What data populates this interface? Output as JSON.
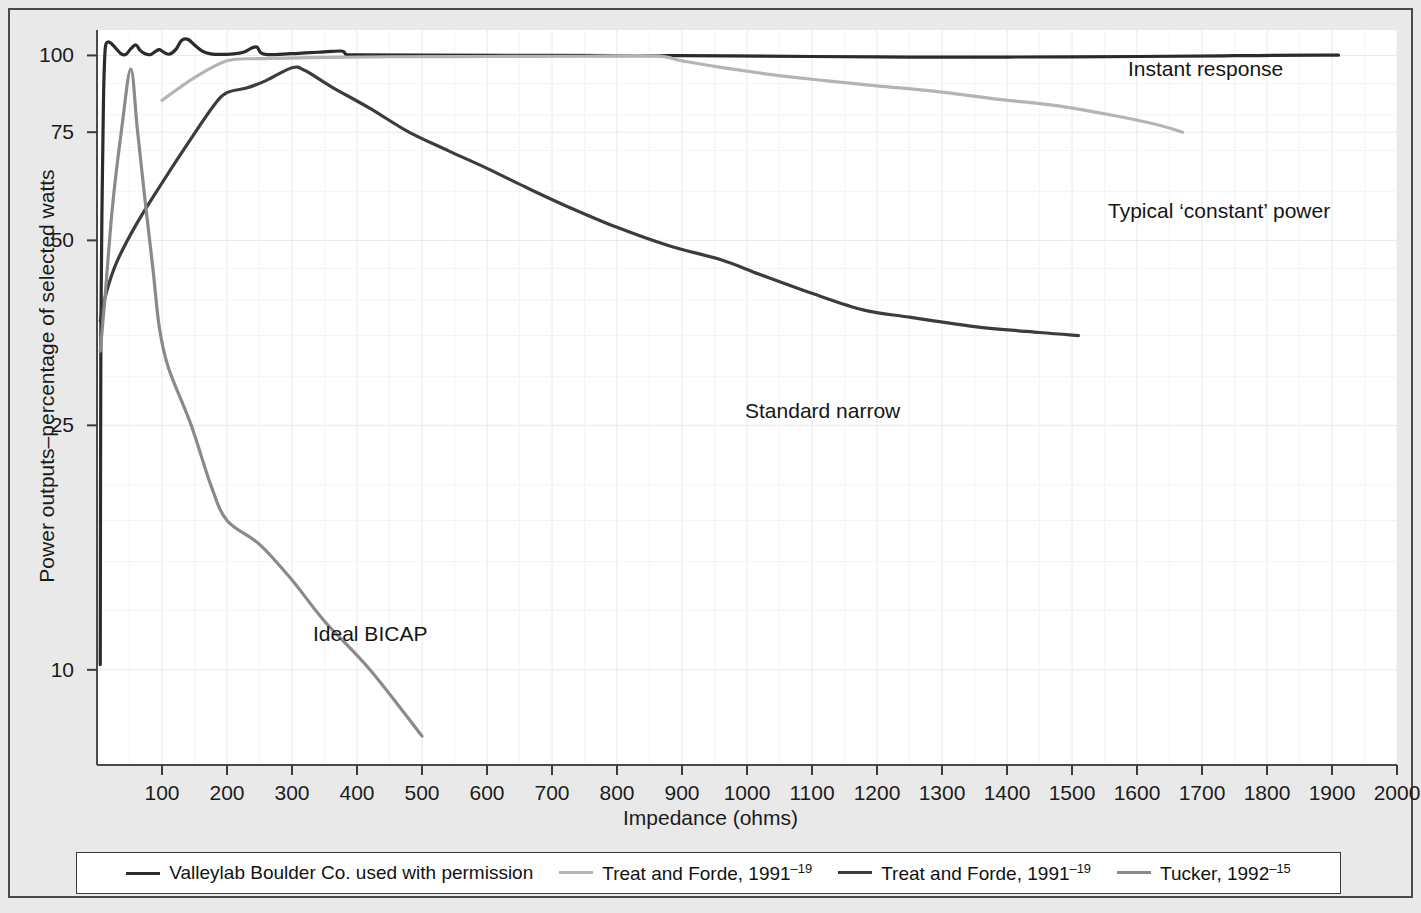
{
  "axes": {
    "y_title": "Power outputs–percentage of selected watts",
    "x_title": "Impedance (ohms)",
    "y_ticks": [
      "10",
      "25",
      "50",
      "75",
      "100"
    ],
    "x_ticks": [
      "100",
      "200",
      "300",
      "400",
      "500",
      "600",
      "700",
      "800",
      "900",
      "1000",
      "1100",
      "1200",
      "1300",
      "1400",
      "1500",
      "1600",
      "1700",
      "1800",
      "1900",
      "2000"
    ]
  },
  "annotations": {
    "instant_response": "Instant response",
    "typical_constant_power": "Typical ‘constant’ power",
    "standard_narrow": "Standard narrow",
    "ideal_bicap": "Ideal BICAP"
  },
  "legend": {
    "items": [
      {
        "label": "Valleylab Boulder Co. used with permission",
        "sup": "",
        "color": "#2b2b2b"
      },
      {
        "label": "Treat and Forde, 1991",
        "sup": "–19",
        "color": "#b4b4b4"
      },
      {
        "label": "Treat and Forde, 1991",
        "sup": "–19",
        "color": "#3c3c3c"
      },
      {
        "label": "Tucker, 1992",
        "sup": "–15",
        "color": "#8a8a8a"
      }
    ]
  },
  "chart_data": {
    "type": "line",
    "title": "",
    "xlabel": "Impedance (ohms)",
    "ylabel": "Power outputs–percentage of selected watts",
    "xlim": [
      0,
      2000
    ],
    "ylim": [
      7,
      110
    ],
    "y_scale": "log",
    "x_scale": "linear",
    "grid": true,
    "legend_position": "bottom",
    "y_ticks": [
      10,
      25,
      50,
      75,
      100
    ],
    "x_ticks": [
      100,
      200,
      300,
      400,
      500,
      600,
      700,
      800,
      900,
      1000,
      1100,
      1200,
      1300,
      1400,
      1500,
      1600,
      1700,
      1800,
      1900,
      2000
    ],
    "series": [
      {
        "name": "Valleylab Boulder Co. used with permission",
        "annotation": "Instant response",
        "color": "#2b2b2b",
        "width": 3.2,
        "points": [
          [
            5,
            10.2
          ],
          [
            6,
            36
          ],
          [
            8,
            60
          ],
          [
            10,
            85
          ],
          [
            12,
            100
          ],
          [
            14,
            104.5
          ],
          [
            20,
            105
          ],
          [
            28,
            103
          ],
          [
            36,
            100.8
          ],
          [
            44,
            100.3
          ],
          [
            52,
            102.5
          ],
          [
            60,
            104
          ],
          [
            66,
            102
          ],
          [
            74,
            100.6
          ],
          [
            82,
            100.3
          ],
          [
            90,
            101.5
          ],
          [
            96,
            102.2
          ],
          [
            104,
            101
          ],
          [
            112,
            100.5
          ],
          [
            122,
            102.5
          ],
          [
            130,
            105.8
          ],
          [
            140,
            106.2
          ],
          [
            150,
            104
          ],
          [
            162,
            101.6
          ],
          [
            175,
            100.6
          ],
          [
            190,
            100.4
          ],
          [
            210,
            100.6
          ],
          [
            225,
            101.2
          ],
          [
            238,
            102.8
          ],
          [
            246,
            103.2
          ],
          [
            252,
            101
          ],
          [
            262,
            100.3
          ],
          [
            280,
            100.4
          ],
          [
            310,
            100.8
          ],
          [
            340,
            101.2
          ],
          [
            360,
            101.5
          ],
          [
            378,
            101.6
          ],
          [
            384,
            100.3
          ],
          [
            400,
            100.2
          ],
          [
            500,
            100.1
          ],
          [
            700,
            100.0
          ],
          [
            900,
            99.9
          ],
          [
            1100,
            99.6
          ],
          [
            1250,
            99.4
          ],
          [
            1400,
            99.4
          ],
          [
            1600,
            99.6
          ],
          [
            1750,
            99.9
          ],
          [
            1880,
            100.1
          ],
          [
            1910,
            100.1
          ]
        ]
      },
      {
        "name": "Treat and Forde, 1991 (typical constant power)",
        "annotation": "Typical ‘constant’ power",
        "color": "#b4b4b4",
        "width": 3.2,
        "points": [
          [
            100,
            84.5
          ],
          [
            150,
            92
          ],
          [
            200,
            98
          ],
          [
            250,
            98.8
          ],
          [
            330,
            99.2
          ],
          [
            450,
            99.5
          ],
          [
            600,
            99.6
          ],
          [
            750,
            99.7
          ],
          [
            860,
            99.8
          ],
          [
            900,
            98.0
          ],
          [
            960,
            95.6
          ],
          [
            1040,
            93.0
          ],
          [
            1120,
            91.0
          ],
          [
            1200,
            89.2
          ],
          [
            1290,
            87.4
          ],
          [
            1380,
            85.0
          ],
          [
            1470,
            83.0
          ],
          [
            1560,
            80.0
          ],
          [
            1630,
            77.2
          ],
          [
            1670,
            75.0
          ]
        ]
      },
      {
        "name": "Treat and Forde, 1991 (standard narrow)",
        "annotation": "Standard narrow",
        "color": "#3c3c3c",
        "width": 3.2,
        "points": [
          [
            5,
            37
          ],
          [
            14,
            41
          ],
          [
            30,
            46
          ],
          [
            60,
            53
          ],
          [
            100,
            62
          ],
          [
            140,
            72
          ],
          [
            180,
            83
          ],
          [
            200,
            87
          ],
          [
            230,
            88.5
          ],
          [
            260,
            91
          ],
          [
            300,
            95.5
          ],
          [
            320,
            94.5
          ],
          [
            360,
            89
          ],
          [
            420,
            82
          ],
          [
            480,
            75
          ],
          [
            540,
            70
          ],
          [
            600,
            65.5
          ],
          [
            660,
            61
          ],
          [
            720,
            57
          ],
          [
            800,
            52.5
          ],
          [
            880,
            49
          ],
          [
            960,
            46.5
          ],
          [
            1020,
            44
          ],
          [
            1100,
            41
          ],
          [
            1180,
            38.5
          ],
          [
            1250,
            37.5
          ],
          [
            1350,
            36.2
          ],
          [
            1450,
            35.4
          ],
          [
            1510,
            35.0
          ]
        ]
      },
      {
        "name": "Tucker, 1992 (ideal BICAP)",
        "annotation": "Ideal BICAP",
        "color": "#8a8a8a",
        "width": 3.2,
        "points": [
          [
            5,
            33
          ],
          [
            12,
            40
          ],
          [
            24,
            57
          ],
          [
            38,
            76
          ],
          [
            52,
            95
          ],
          [
            62,
            76
          ],
          [
            74,
            58
          ],
          [
            86,
            45
          ],
          [
            96,
            36
          ],
          [
            110,
            31
          ],
          [
            145,
            25
          ],
          [
            175,
            20
          ],
          [
            200,
            17.5
          ],
          [
            250,
            16
          ],
          [
            300,
            14
          ],
          [
            350,
            12
          ],
          [
            420,
            10
          ],
          [
            500,
            7.8
          ]
        ]
      }
    ]
  }
}
